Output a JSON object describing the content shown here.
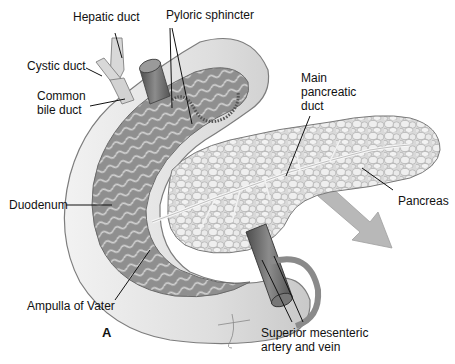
{
  "figure": {
    "panel_letter": "A",
    "colors": {
      "background": "#ffffff",
      "duodenum_wall": "#e4e4e4",
      "duodenum_inner": "#9a9a9a",
      "mucosal_folds": "#cfcfcf",
      "pancreas_lobules": "#e8e8e8",
      "pancreas_outline": "#8a8a8a",
      "duct": "#f5f5f5",
      "vessel": "#6e6e6e",
      "arrow": "#b5b5b5",
      "label_text": "#111111"
    }
  },
  "labels": {
    "hepatic_duct": "Hepatic duct",
    "cystic_duct": "Cystic duct",
    "common_bile_duct": "Common bile duct",
    "pyloric_sphincter": "Pyloric sphincter",
    "main_pancreatic_duct": "Main pancreatic duct",
    "pancreas": "Pancreas",
    "duodenum": "Duodenum",
    "ampulla_of_vater": "Ampulla of Vater",
    "superior_mesenteric": "Superior mesenteric artery and vein"
  }
}
